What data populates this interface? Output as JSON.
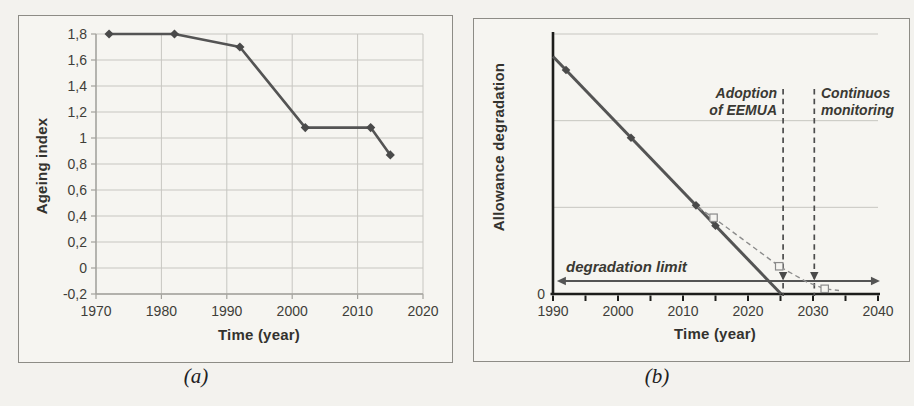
{
  "colors": {
    "background": "#f3f2ee",
    "panel_background": "#f6f5f1",
    "panel_border": "#8d8c86",
    "grid": "#c7c6c1",
    "axis_light": "#a3a29d",
    "axis_dark": "#1d1d1b",
    "line": "#545454",
    "marker": "#4a4a4a",
    "dashed": "#8c8c8c",
    "text": "#3f3e39"
  },
  "chart_data": [
    {
      "id": "a",
      "type": "line",
      "caption": "(a)",
      "xlabel": "Time (year)",
      "ylabel": "Ageing index",
      "xlim": [
        1970,
        2020
      ],
      "ylim": [
        -0.2,
        1.8
      ],
      "grid": "on",
      "x_ticks": [
        {
          "v": 1970,
          "label": "1970"
        },
        {
          "v": 1980,
          "label": "1980"
        },
        {
          "v": 1990,
          "label": "1990"
        },
        {
          "v": 2000,
          "label": "2000"
        },
        {
          "v": 2010,
          "label": "2010"
        },
        {
          "v": 2020,
          "label": "2020"
        }
      ],
      "y_ticks": [
        {
          "v": 1.8,
          "label": "1,8"
        },
        {
          "v": 1.6,
          "label": "1,6"
        },
        {
          "v": 1.4,
          "label": "1,4"
        },
        {
          "v": 1.2,
          "label": "1,2"
        },
        {
          "v": 1.0,
          "label": "1"
        },
        {
          "v": 0.8,
          "label": "0,8"
        },
        {
          "v": 0.6,
          "label": "0,6"
        },
        {
          "v": 0.4,
          "label": "0,4"
        },
        {
          "v": 0.2,
          "label": "0,2"
        },
        {
          "v": 0.0,
          "label": "0"
        },
        {
          "v": -0.2,
          "label": "-0,2"
        }
      ],
      "points": [
        [
          1972,
          1.8
        ],
        [
          1982,
          1.8
        ],
        [
          1992,
          1.7
        ],
        [
          2002,
          1.08
        ],
        [
          2012,
          1.08
        ],
        [
          2015,
          0.87
        ]
      ],
      "marker": "diamond"
    },
    {
      "id": "b",
      "type": "line",
      "caption": "(b)",
      "xlabel": "Time (year)",
      "ylabel": "Allowance degradation",
      "xlim": [
        1990,
        2040
      ],
      "ylim": [
        0,
        3
      ],
      "grid": "horizontal-only",
      "gridline_values": [
        1,
        2,
        3
      ],
      "x_ticks": [
        {
          "v": 1990,
          "label": "1990"
        },
        {
          "v": 2000,
          "label": "2000"
        },
        {
          "v": 2010,
          "label": "2010"
        },
        {
          "v": 2020,
          "label": "2020"
        },
        {
          "v": 2030,
          "label": "2030"
        },
        {
          "v": 2040,
          "label": "2040"
        }
      ],
      "x_minor_step": 5,
      "y_ticks": [
        {
          "v": 0,
          "label": "0"
        }
      ],
      "solid_series": {
        "points": [
          [
            1990,
            2.74
          ],
          [
            2025.1,
            0
          ]
        ],
        "marker": "diamond",
        "marker_years": [
          1992,
          2002,
          2012,
          2015
        ]
      },
      "dashed_series": {
        "points": [
          [
            2012.3,
            1.0
          ],
          [
            2014.7,
            0.88
          ],
          [
            2024.8,
            0.32
          ],
          [
            2029,
            0.14
          ],
          [
            2031.8,
            0.06
          ],
          [
            2034,
            0.04
          ]
        ],
        "marker": "square",
        "square_points": [
          [
            2014.7,
            0.88
          ],
          [
            2024.8,
            0.32
          ],
          [
            2031.8,
            0.06
          ]
        ]
      },
      "limit_line": {
        "label": "degradation limit",
        "value": 0.15,
        "x_from": 1990.6,
        "x_to": 2040.3,
        "style": "double-arrow"
      },
      "vlines": [
        {
          "year": 2025.4,
          "label_lines": [
            "Adoption",
            "of EEMUA"
          ],
          "label_align": "right"
        },
        {
          "year": 2030.2,
          "label_lines": [
            "Continuos",
            "monitoring"
          ],
          "label_align": "left"
        }
      ]
    }
  ]
}
